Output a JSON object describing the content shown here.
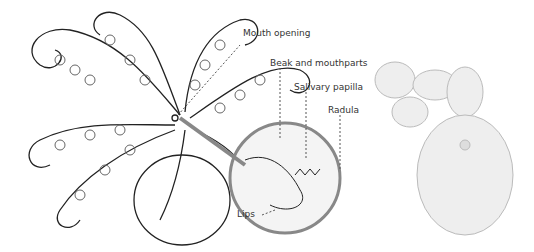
{
  "diagram": {
    "labels": {
      "mouth_opening": "Mouth opening",
      "beak": "Beak and mouthparts",
      "salivary": "Salivary papilla",
      "radula": "Radula",
      "lips": "Lips"
    }
  },
  "photo": {
    "subject": "drilled shells"
  }
}
